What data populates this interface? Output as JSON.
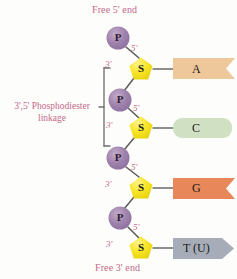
{
  "figure": {
    "title_top": "Free 5' end",
    "title_bottom": "Free 3' end",
    "linkage_label_line1": "3',5' Phosphodiester",
    "linkage_label_line2": "linkage",
    "background_color": "#fdfdfb",
    "label_text_color": "#c4688a"
  },
  "nodes": {
    "phosphates": [
      {
        "symbol": "P",
        "cx": 118,
        "cy": 38,
        "r": 11.5,
        "fill": "#9b7fa8"
      },
      {
        "symbol": "P",
        "cx": 120,
        "cy": 100,
        "r": 11.5,
        "fill": "#9b7fa8"
      },
      {
        "symbol": "P",
        "cx": 118,
        "cy": 158,
        "r": 11.5,
        "fill": "#9b7fa8"
      },
      {
        "symbol": "P",
        "cx": 120,
        "cy": 218,
        "r": 11.5,
        "fill": "#9b7fa8"
      }
    ],
    "sugars": [
      {
        "symbol": "S",
        "cx": 141,
        "cy": 69,
        "r": 12,
        "fill": "#f5e020"
      },
      {
        "symbol": "S",
        "cx": 141,
        "cy": 128,
        "r": 12,
        "fill": "#f5e020"
      },
      {
        "symbol": "S",
        "cx": 141,
        "cy": 188,
        "r": 12,
        "fill": "#f5e020"
      },
      {
        "symbol": "S",
        "cx": 141,
        "cy": 248,
        "r": 12,
        "fill": "#f5e020"
      }
    ]
  },
  "primes": [
    {
      "text": "5'",
      "x": 131,
      "y": 47
    },
    {
      "text": "3'",
      "x": 106,
      "y": 63
    },
    {
      "text": "5'",
      "x": 133,
      "y": 107
    },
    {
      "text": "3'",
      "x": 107,
      "y": 124
    },
    {
      "text": "5'",
      "x": 131,
      "y": 166
    },
    {
      "text": "3'",
      "x": 106,
      "y": 183
    },
    {
      "text": "5'",
      "x": 133,
      "y": 226
    },
    {
      "text": "3'",
      "x": 107,
      "y": 243
    }
  ],
  "bases": [
    {
      "label": "A",
      "name": "adenine",
      "shape": "ribbon-notched",
      "fill": "#eec79b",
      "x": 172,
      "y": 58,
      "w": 63,
      "h": 21,
      "label_x": 192,
      "label_y": 62
    },
    {
      "label": "C",
      "name": "cytosine",
      "shape": "rounded-rect",
      "fill": "#cfe0c3",
      "x": 172,
      "y": 118,
      "w": 60,
      "h": 20,
      "label_x": 192,
      "label_y": 121
    },
    {
      "label": "G",
      "name": "guanine",
      "shape": "ribbon-notched",
      "fill": "#e8875a",
      "x": 172,
      "y": 178,
      "w": 63,
      "h": 21,
      "label_x": 192,
      "label_y": 181
    },
    {
      "label": "T (U)",
      "name": "thymine-uracil",
      "shape": "pentagon-arrow",
      "fill": "#a6adb8",
      "x": 172,
      "y": 238,
      "w": 63,
      "h": 21,
      "label_x": 183,
      "label_y": 241
    }
  ],
  "bracket": {
    "x": 104,
    "y_top": 68,
    "y_bottom": 146,
    "color": "#6d6d6d"
  },
  "colors": {
    "phosphate": "#9b7fa8",
    "phosphate_highlight": "#c0a8c9",
    "sugar": "#f5e020",
    "sugar_highlight": "#fbf07f",
    "bond_line": "#5a5a5a",
    "base_adenine": "#eec79b",
    "base_cytosine": "#cfe0c3",
    "base_guanine": "#e8875a",
    "base_thymine": "#a6adb8"
  }
}
